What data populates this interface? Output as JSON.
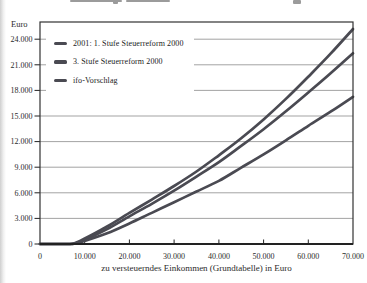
{
  "chart_data": {
    "type": "line",
    "title": "",
    "ylabel": "Euro",
    "xlabel": "zu versteuerndes Einkommen (Grundtabelle) in Euro",
    "x_range": [
      0,
      70000
    ],
    "y_range": [
      0,
      26000
    ],
    "grid": "horizontal",
    "legend_position": "top-left inside plot area, white background",
    "y_ticks": [
      {
        "value": 24000,
        "label": "24.000"
      },
      {
        "value": 21000,
        "label": "21.000"
      },
      {
        "value": 18000,
        "label": "18.000"
      },
      {
        "value": 15000,
        "label": "15.000"
      },
      {
        "value": 12000,
        "label": "12.000"
      },
      {
        "value": 9000,
        "label": "9.000"
      },
      {
        "value": 6000,
        "label": "6.000"
      },
      {
        "value": 3000,
        "label": "3.000"
      },
      {
        "value": 0,
        "label": "0"
      }
    ],
    "x_ticks": [
      {
        "value": 0,
        "label": "0"
      },
      {
        "value": 10000,
        "label": "10.000"
      },
      {
        "value": 20000,
        "label": "20.000"
      },
      {
        "value": 30000,
        "label": "30.000"
      },
      {
        "value": 40000,
        "label": "40.000"
      },
      {
        "value": 50000,
        "label": "50.000"
      },
      {
        "value": 60000,
        "label": "60.000"
      },
      {
        "value": 70000,
        "label": "70.000"
      }
    ],
    "series": [
      {
        "name": "2001: 1. Stufe Steuerreform 2000",
        "color": "#4a4a52",
        "points": [
          [
            0,
            0
          ],
          [
            6700,
            0
          ],
          [
            10000,
            650
          ],
          [
            15000,
            2050
          ],
          [
            20000,
            3650
          ],
          [
            25000,
            5200
          ],
          [
            30000,
            6800
          ],
          [
            35000,
            8500
          ],
          [
            40000,
            10400
          ],
          [
            45000,
            12400
          ],
          [
            50000,
            14600
          ],
          [
            55000,
            17000
          ],
          [
            60000,
            19600
          ],
          [
            65000,
            22300
          ],
          [
            70000,
            25200
          ]
        ]
      },
      {
        "name": "3. Stufe Steuerreform 2000",
        "color": "#4a4a52",
        "points": [
          [
            0,
            0
          ],
          [
            7200,
            0
          ],
          [
            10000,
            480
          ],
          [
            15000,
            1750
          ],
          [
            20000,
            3250
          ],
          [
            25000,
            4700
          ],
          [
            30000,
            6250
          ],
          [
            35000,
            7900
          ],
          [
            40000,
            9600
          ],
          [
            45000,
            11500
          ],
          [
            50000,
            13450
          ],
          [
            55000,
            15550
          ],
          [
            60000,
            17750
          ],
          [
            65000,
            20000
          ],
          [
            70000,
            22350
          ]
        ]
      },
      {
        "name": "ifo-Vorschlag",
        "color": "#4a4a52",
        "points": [
          [
            0,
            0
          ],
          [
            7200,
            0
          ],
          [
            10000,
            380
          ],
          [
            15000,
            1250
          ],
          [
            20000,
            2400
          ],
          [
            25000,
            3650
          ],
          [
            30000,
            4900
          ],
          [
            35000,
            6150
          ],
          [
            40000,
            7400
          ],
          [
            45000,
            8950
          ],
          [
            50000,
            10500
          ],
          [
            55000,
            12150
          ],
          [
            60000,
            13850
          ],
          [
            65000,
            15500
          ],
          [
            70000,
            17250
          ]
        ]
      }
    ]
  },
  "colors": {
    "line": "#4a4a52",
    "grid": "#999999",
    "frame": "#333333",
    "axis": "#222222",
    "text": "#2b2b2b"
  }
}
